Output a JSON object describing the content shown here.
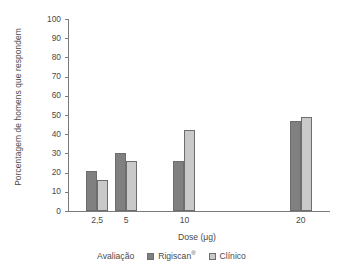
{
  "chart_data": {
    "type": "bar",
    "title": "",
    "xlabel": "Dose (μg)",
    "ylabel": "Porcentagem de homens que respondem",
    "categories": [
      "2,5",
      "5",
      "10",
      "20"
    ],
    "x_numeric": [
      2.5,
      5,
      10,
      20
    ],
    "x_axis_scale": "linear-dose",
    "xlim": [
      0,
      22.5
    ],
    "ylim": [
      0,
      100
    ],
    "yticks": [
      0,
      10,
      20,
      30,
      40,
      50,
      60,
      70,
      80,
      90,
      100
    ],
    "ytick_labels": [
      "0",
      "10",
      "20",
      "30",
      "40",
      "50",
      "60",
      "70",
      "80",
      "90",
      "100"
    ],
    "grid": false,
    "legend_position": "bottom-center",
    "series": [
      {
        "name": "Rigiscan®",
        "name_base": "Rigiscan",
        "name_sup": "®",
        "color": "#808080",
        "values": [
          21,
          30,
          26,
          47
        ]
      },
      {
        "name": "Clínico",
        "name_base": "Clínico",
        "name_sup": "",
        "color": "#c9c9c9",
        "values": [
          16,
          26,
          42,
          49
        ]
      }
    ],
    "legend_title": "Avaliação",
    "axis_color": "#7b7b7b",
    "bar_border_color": "#6d6d6d",
    "text_color": "#4a4a4a"
  },
  "legend": {
    "title": "Avaliação",
    "items": [
      {
        "label": "Rigiscan",
        "sup": "®",
        "swatch": "dark"
      },
      {
        "label": "Clínico",
        "sup": "",
        "swatch": "light"
      }
    ]
  },
  "axes": {
    "y_title": "Porcentagem de homens que respondem",
    "x_title": "Dose (μg)",
    "y_ticks": [
      "100",
      "90",
      "80",
      "70",
      "60",
      "50",
      "40",
      "30",
      "20",
      "10",
      "0"
    ],
    "x_ticks": [
      "2,5",
      "5",
      "10",
      "20"
    ]
  }
}
